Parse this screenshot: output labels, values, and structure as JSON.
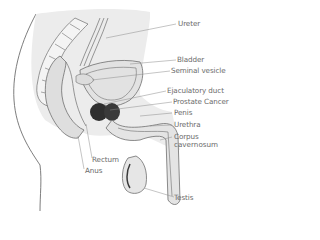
{
  "diagram": {
    "colors": {
      "background": "#ffffff",
      "tissue_fill": "#e6e6e6",
      "outline": "#6e6e6e",
      "prostate": "#2f2f2f",
      "label_text": "#6a6a6a",
      "leader_line": "#8a8a8a"
    },
    "labels": [
      {
        "id": "ureter",
        "text": "Ureter"
      },
      {
        "id": "bladder",
        "text": "Bladder"
      },
      {
        "id": "seminal-vesicle",
        "text": "Seminal vesicle"
      },
      {
        "id": "ejaculatory-duct",
        "text": "Ejaculatory duct"
      },
      {
        "id": "prostate-cancer",
        "text": "Prostate Cancer"
      },
      {
        "id": "penis",
        "text": "Penis"
      },
      {
        "id": "urethra",
        "text": "Urethra"
      },
      {
        "id": "corpus-cavernosum",
        "text": "Corpus",
        "text2": "cavernosum"
      },
      {
        "id": "rectum",
        "text": "Rectum"
      },
      {
        "id": "anus",
        "text": "Anus"
      },
      {
        "id": "testis",
        "text": "Testis"
      }
    ]
  }
}
